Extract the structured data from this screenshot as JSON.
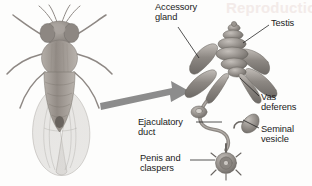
{
  "figure": {
    "background_color": "#fdfdfc",
    "arrow": {
      "name": "pointer-arrow",
      "color": "#8c8c8c",
      "direction": "right"
    },
    "watermark": {
      "text": "Reproduction",
      "color": "#f3ebe9"
    },
    "specimen": {
      "name": "drosophila-fly",
      "description": "Dorsal view of an adult fruit fly",
      "color": "#9a9490"
    },
    "anatomy_colors": {
      "organ_mid": "#8e8a86",
      "organ_light": "#b5b1ac",
      "organ_dark": "#6d6965",
      "leader_line": "#2a2a2a"
    },
    "labels": [
      {
        "id": "accessory-gland",
        "text": "Accessory\ngland"
      },
      {
        "id": "testis",
        "text": "Testis"
      },
      {
        "id": "vas-deferens",
        "text": "Vas\ndeferens"
      },
      {
        "id": "seminal-vesicle",
        "text": "Seminal\nvesicle"
      },
      {
        "id": "ejaculatory-duct",
        "text": "Ejaculatory\nduct"
      },
      {
        "id": "penis-claspers",
        "text": "Penis and\nclaspers"
      }
    ]
  }
}
